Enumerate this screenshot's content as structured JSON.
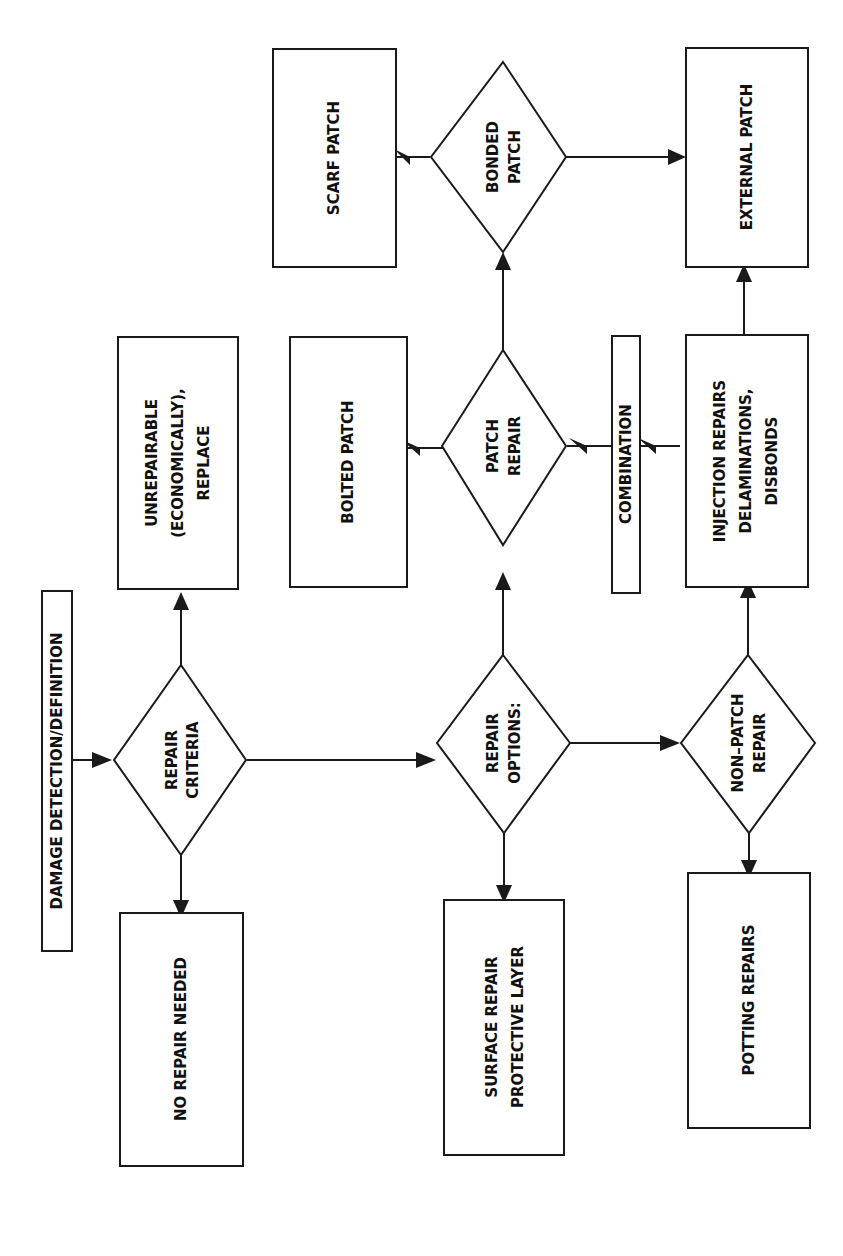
{
  "diagram": {
    "orientation": "rotated-90-ccw",
    "colors": {
      "line": "#1a1a1a",
      "background": "#ffffff",
      "text": "#111111"
    },
    "nodes": {
      "damage_detection": {
        "type": "box",
        "lines": [
          "DAMAGE  DETECTION/DEFINITION"
        ]
      },
      "repair_criteria": {
        "type": "diamond",
        "lines": [
          "REPAIR",
          "CRITERIA"
        ]
      },
      "unrepairable": {
        "type": "box",
        "lines": [
          "UNREPAIRABLE",
          "(ECONOMICALLY),",
          "REPLACE"
        ]
      },
      "no_repair": {
        "type": "box",
        "lines": [
          "NO REPAIR NEEDED"
        ]
      },
      "repair_options": {
        "type": "diamond",
        "lines": [
          "REPAIR",
          "OPTIONS:"
        ]
      },
      "surface_repair": {
        "type": "box",
        "lines": [
          "SURFACE REPAIR",
          "PROTECTIVE LAYER"
        ]
      },
      "patch_repair": {
        "type": "diamond",
        "lines": [
          "PATCH",
          "REPAIR"
        ]
      },
      "bolted_patch": {
        "type": "box",
        "lines": [
          "BOLTED PATCH"
        ]
      },
      "bonded_patch": {
        "type": "diamond",
        "lines": [
          "BONDED",
          "PATCH"
        ]
      },
      "scarf_patch": {
        "type": "box",
        "lines": [
          "SCARF PATCH"
        ]
      },
      "external_patch": {
        "type": "box",
        "lines": [
          "EXTERNAL PATCH"
        ]
      },
      "combination": {
        "type": "box",
        "lines": [
          "COMBINATION"
        ]
      },
      "non_patch_repair": {
        "type": "diamond",
        "lines": [
          "NON–PATCH",
          "REPAIR"
        ]
      },
      "injection_repairs": {
        "type": "box",
        "lines": [
          "INJECTION REPAIRS",
          "DELAMINATIONS,",
          "DISBONDS"
        ]
      },
      "potting_repairs": {
        "type": "box",
        "lines": [
          "POTTING REPAIRS"
        ]
      }
    }
  }
}
